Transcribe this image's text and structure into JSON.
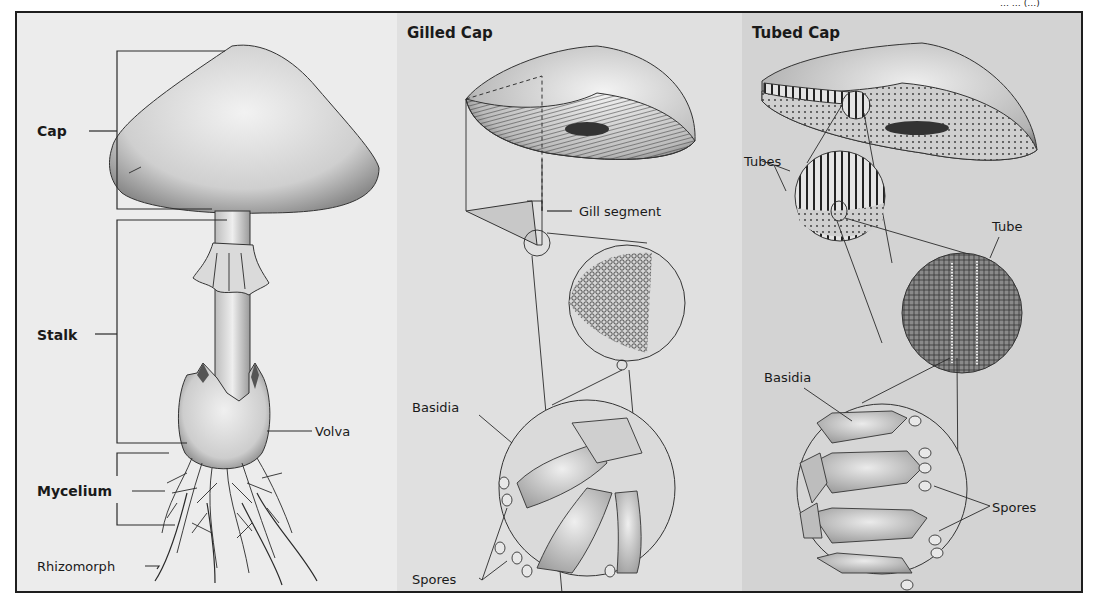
{
  "header": {
    "cropped_text": "…  … (…)"
  },
  "panels": [
    {
      "id": "whole-mushroom",
      "background": "#ececec",
      "labels": {
        "cap": "Cap",
        "stalk": "Stalk",
        "volva": "Volva",
        "mycelium": "Mycelium",
        "rhizomorph": "Rhizomorph"
      }
    },
    {
      "id": "gilled-cap",
      "background": "#e0e0e0",
      "title": "Gilled Cap",
      "labels": {
        "gill_segment": "Gill segment",
        "basidia": "Basidia",
        "spores": "Spores"
      }
    },
    {
      "id": "tubed-cap",
      "background": "#d3d3d3",
      "title": "Tubed Cap",
      "labels": {
        "tubes": "Tubes",
        "tube": "Tube",
        "basidia": "Basidia",
        "spores": "Spores"
      }
    }
  ],
  "colors": {
    "border": "#1e1e1e",
    "ink": "#1a1a1a",
    "page": "#ffffff"
  }
}
